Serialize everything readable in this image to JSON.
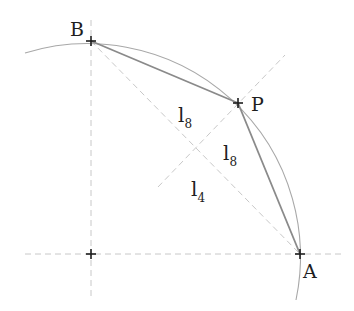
{
  "diagram": {
    "colors": {
      "arc": "#a8a8a8",
      "chord": "#8a8a8a",
      "dashed": "#c8c8c8",
      "marker": "#1e1e1e",
      "text": "#1e1e1e"
    },
    "points": {
      "O": {
        "label": "",
        "x": 91,
        "y": 254
      },
      "B": {
        "label": "B",
        "x": 91,
        "y": 41
      },
      "P": {
        "label": "P",
        "x": 238,
        "y": 103
      },
      "A": {
        "label": "A",
        "x": 300,
        "y": 254
      }
    },
    "segment_labels": {
      "l8_upper": {
        "base": "l",
        "sub": "8"
      },
      "l8_lower": {
        "base": "l",
        "sub": "8"
      },
      "l4": {
        "base": "l",
        "sub": "4"
      }
    }
  }
}
